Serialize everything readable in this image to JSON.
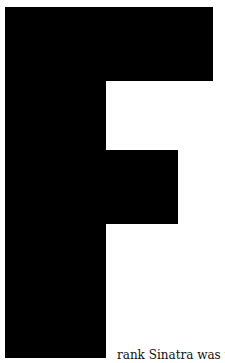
{
  "drop_cap": {
    "letter": "F",
    "color": "#000000"
  },
  "body_text": "rank Sinatra was th"
}
